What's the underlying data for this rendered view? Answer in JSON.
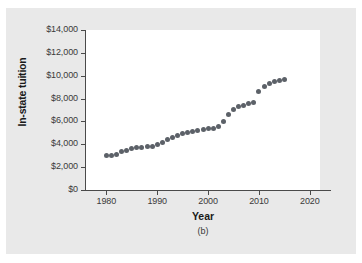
{
  "chart_data": {
    "type": "scatter",
    "title": "",
    "subfigure_label": "(b)",
    "xlabel": "Year",
    "ylabel": "In-state tuition",
    "xlim": [
      1976,
      2022
    ],
    "ylim": [
      0,
      14000
    ],
    "grid": false,
    "legend": null,
    "marker_color": "#5c6168",
    "plot_background": "#ffffff",
    "page_background": "#e9e9e9",
    "x_ticks": [
      1980,
      1990,
      2000,
      2010,
      2020
    ],
    "x_tick_labels": [
      "1980",
      "1990",
      "2000",
      "2010",
      "2020"
    ],
    "y_ticks": [
      0,
      2000,
      4000,
      6000,
      8000,
      10000,
      12000,
      14000
    ],
    "y_tick_labels": [
      "$0",
      "$2,000",
      "$4,000",
      "$6,000",
      "$8,000",
      "$10,000",
      "$12,000",
      "$14,000"
    ],
    "x": [
      1980,
      1981,
      1982,
      1983,
      1984,
      1985,
      1986,
      1987,
      1988,
      1989,
      1990,
      1991,
      1992,
      1993,
      1994,
      1995,
      1996,
      1997,
      1998,
      1999,
      2000,
      2001,
      2002,
      2003,
      2004,
      2005,
      2006,
      2007,
      2008,
      2009,
      2010,
      2011,
      2012,
      2013,
      2014,
      2015
    ],
    "y": [
      3000,
      3050,
      3150,
      3350,
      3450,
      3600,
      3700,
      3750,
      3780,
      3850,
      3950,
      4150,
      4400,
      4600,
      4800,
      4950,
      5050,
      5100,
      5200,
      5300,
      5350,
      5400,
      5600,
      6000,
      6600,
      7050,
      7300,
      7400,
      7600,
      7620,
      8650,
      9100,
      9350,
      9500,
      9600,
      9700
    ],
    "series": [
      {
        "name": "In-state tuition",
        "values": [
          3000,
          3050,
          3150,
          3350,
          3450,
          3600,
          3700,
          3750,
          3780,
          3850,
          3950,
          4150,
          4400,
          4600,
          4800,
          4950,
          5050,
          5100,
          5200,
          5300,
          5350,
          5400,
          5600,
          6000,
          6600,
          7050,
          7300,
          7400,
          7600,
          7620,
          8650,
          9100,
          9350,
          9500,
          9600,
          9700
        ]
      }
    ]
  }
}
